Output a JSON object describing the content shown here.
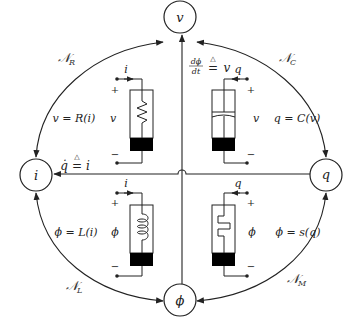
{
  "nodes": {
    "v": {
      "label": "v"
    },
    "i": {
      "label": "i"
    },
    "q": {
      "label": "q"
    },
    "phi": {
      "label": "ϕ"
    }
  },
  "axes": {
    "vertical_relation": {
      "lhs_num": "dϕ",
      "lhs_den": "dt",
      "def": "△",
      "eq": "=",
      "rhs": "v"
    },
    "horizontal_relation": {
      "lhs": "q̇",
      "def": "△",
      "eq": "=",
      "rhs": "i"
    }
  },
  "arcs": {
    "resistor": {
      "main": "𝒩",
      "sub": "R"
    },
    "capacitor": {
      "main": "𝒩",
      "sub": "C"
    },
    "inductor": {
      "main": "𝒩",
      "sub": "L"
    },
    "memristor": {
      "main": "𝒩",
      "sub": "M"
    }
  },
  "elements": {
    "resistor": {
      "relation": "v = R(i)",
      "terminal_var": "v",
      "current_label": "i",
      "plus": "+",
      "minus": "−"
    },
    "capacitor": {
      "relation": "q = C(v)",
      "terminal_var": "v",
      "current_label": "q",
      "plus": "+",
      "minus": "−"
    },
    "inductor": {
      "relation": "ϕ = L(i)",
      "terminal_var": "ϕ",
      "current_label": "i",
      "plus": "+",
      "minus": "−"
    },
    "memristor": {
      "relation": "ϕ = s(q)",
      "terminal_var": "ϕ",
      "current_label": "q",
      "plus": "+",
      "minus": "−"
    }
  },
  "colors": {
    "line": "#222222",
    "fill_dark": "#000000",
    "background": "#ffffff"
  }
}
